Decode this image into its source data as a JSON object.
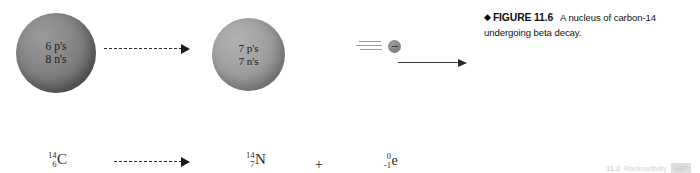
{
  "figure": {
    "diamond": "◆",
    "label": "FIGURE 11.6",
    "caption": "A nucleus of carbon-14 undergoing beta decay."
  },
  "nuclei": {
    "reactant": {
      "name": "carbon-14-nucleus",
      "protons_label": "6 p's",
      "neutrons_label": "8 n's",
      "fill_color": "#7e7e7e"
    },
    "product": {
      "name": "nitrogen-14-nucleus",
      "protons_label": "7 p's",
      "neutrons_label": "7 n's",
      "fill_color": "#9a9a9a"
    }
  },
  "beta_particle": {
    "charge_sign": "−",
    "dot_color": "#8a8a8a",
    "speed_line_color": "#9d9d9d"
  },
  "equation": {
    "reactant": {
      "mass_number": "14",
      "atomic_number": "6",
      "symbol": "C"
    },
    "product": {
      "mass_number": "14",
      "atomic_number": "7",
      "symbol": "N"
    },
    "emitted": {
      "mass_number": "0",
      "atomic_number": "-1",
      "symbol": "e"
    },
    "plus": "+"
  },
  "footer": {
    "section": "11.2",
    "title": "Radioactivity",
    "page_number": "447"
  }
}
